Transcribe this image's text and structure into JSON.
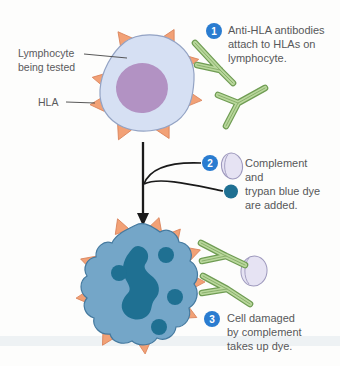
{
  "labels": {
    "lymphocyte_line1": "Lymphocyte",
    "lymphocyte_line2": "being tested",
    "hla": "HLA"
  },
  "steps": {
    "step1": {
      "number": "1",
      "line1": "Anti-HLA antibodies",
      "line2": "attach to HLAs on",
      "line3": "lymphocyte."
    },
    "step2": {
      "number": "2",
      "line1": "Complement",
      "line2": "and",
      "line3": "trypan blue dye",
      "line4": "are added."
    },
    "step3": {
      "number": "3",
      "line1": "Cell damaged",
      "line2": "by complement",
      "line3": "takes up dye."
    }
  },
  "icons": {
    "lymphocyte_cell": "light-blue cell with purple nucleus and orange HLA spikes",
    "hla_spike": "orange triangle antigen",
    "antibody": "green Y-shaped antibody",
    "complement": "lavender sphere",
    "trypan_blue_dye": "dark teal dot",
    "damaged_cell": "blue cell filled with dark dye spots",
    "flow_arrow": "downward arrow with two merging lines"
  },
  "colors": {
    "background": "#fdfdfc",
    "step_badge": "#2a7cd0",
    "cell_body": "#d6e0f3",
    "cell_outline": "#93a3c4",
    "nucleus": "#b292c3",
    "hla_spike": "#f2a176",
    "hla_spike_outline": "#d9825a",
    "antibody_fill": "#b9d79c",
    "antibody_outline": "#6f9c53",
    "complement_fill": "#e6e3f3",
    "complement_outline": "#9e99bd",
    "trypan_blue_dye": "#1f7092",
    "damaged_cell_body": "#74a6c8",
    "damaged_cell_outline": "#44799f",
    "label_text": "#5a5a5c",
    "arrow": "#1a1a1a"
  }
}
